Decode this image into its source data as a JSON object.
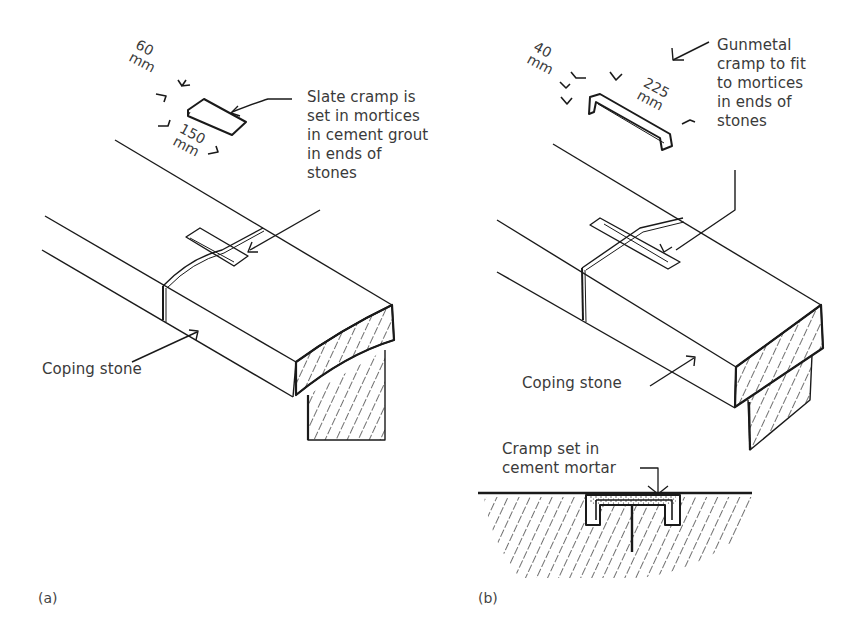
{
  "figure": {
    "panels": [
      {
        "id": "a",
        "tag": "(a)",
        "cramp_label": "Slate cramp is\nset in mortices\nin cement grout\nin ends of\nstones",
        "dimensions": {
          "width": "60\nmm",
          "length": "150\nmm"
        },
        "coping_label": "Coping stone"
      },
      {
        "id": "b",
        "tag": "(b)",
        "cramp_label": "Gunmetal\ncramp to fit\nto mortices\nin ends of\nstones",
        "dimensions": {
          "width": "40\nmm",
          "length": "225\nmm"
        },
        "coping_label": "Coping stone",
        "section_label": "Cramp set in\ncement mortar"
      }
    ]
  }
}
